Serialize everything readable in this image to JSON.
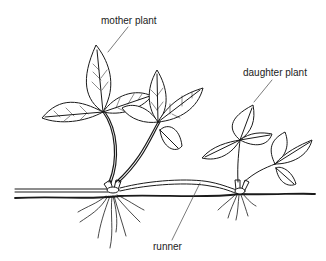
{
  "diagram": {
    "type": "labeled-illustration",
    "labels": [
      {
        "id": "mother",
        "text": "mother plant",
        "x": 101,
        "y": 16
      },
      {
        "id": "daughter",
        "text": "daughter plant",
        "x": 243,
        "y": 68
      },
      {
        "id": "runner",
        "text": "runner",
        "x": 153,
        "y": 111
      }
    ],
    "stroke_color": "#1a1a1a",
    "background": "#ffffff"
  }
}
